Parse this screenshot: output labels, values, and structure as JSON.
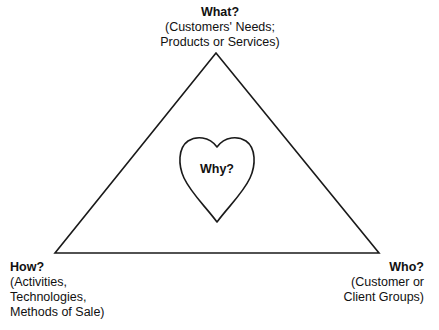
{
  "diagram": {
    "type": "triangle-with-heart",
    "stroke_color": "#1a1a1a",
    "background": "#ffffff",
    "vertices": {
      "top": {
        "title": "What?",
        "lines": [
          "(Customers' Needs;",
          "Products or Services)"
        ]
      },
      "bottom_left": {
        "title": "How?",
        "lines": [
          "(Activities,",
          "Technologies,",
          "Methods of Sale)"
        ]
      },
      "bottom_right": {
        "title": "Who?",
        "lines": [
          "(Customer or",
          "Client Groups)"
        ]
      }
    },
    "center": {
      "shape": "heart",
      "label": "Why?"
    }
  }
}
